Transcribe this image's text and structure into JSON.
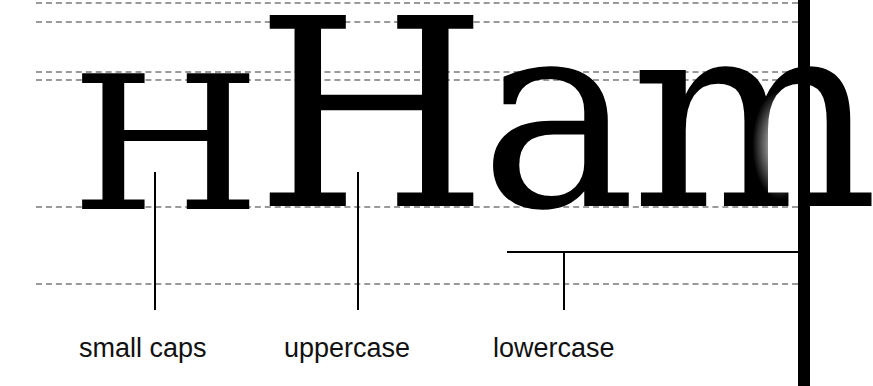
{
  "diagram": {
    "glyphs": {
      "small_caps": "H",
      "uppercase": "H",
      "lowercase": "am",
      "lowercase_lead": "a",
      "lowercase_tail": "m"
    },
    "labels": {
      "small_caps": "small caps",
      "uppercase": "uppercase",
      "lowercase": "lowercase"
    },
    "guides": {
      "count": 6,
      "style": "dashed",
      "color": "#9a9a9a"
    },
    "colors": {
      "ink": "#000000",
      "background": "#ffffff",
      "guide": "#9a9a9a"
    }
  }
}
